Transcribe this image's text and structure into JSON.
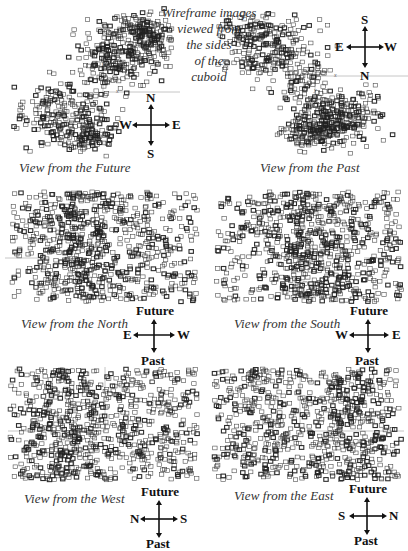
{
  "figure": {
    "background": "#ffffff",
    "marker_color": "#222222",
    "axis_color": "#b8b8b8",
    "annotation": {
      "lines": [
        "Wireframe images",
        "viewed from",
        "the sides",
        "of the",
        "cuboid"
      ]
    },
    "panels": [
      {
        "id": "future",
        "caption": "View from the Future",
        "axis_labels": {
          "vertical": "y",
          "horizontal": "x"
        },
        "compass": {
          "top": "N",
          "bottom": "S",
          "left": "W",
          "right": "E"
        },
        "point_count": 700,
        "seed": 11
      },
      {
        "id": "past",
        "caption": "View from the Past",
        "axis_labels": {
          "vertical": "y",
          "horizontal": "x"
        },
        "compass": {
          "top": "S",
          "bottom": "N",
          "left": "E",
          "right": "W"
        },
        "point_count": 700,
        "seed": 23
      },
      {
        "id": "north",
        "caption": "View from the North",
        "compass": {
          "top": "Future",
          "bottom": "Past",
          "left": "E",
          "right": "W"
        },
        "point_count": 820,
        "seed": 37
      },
      {
        "id": "south",
        "caption": "View from the South",
        "compass": {
          "top": "Future",
          "bottom": "Past",
          "left": "W",
          "right": "E"
        },
        "point_count": 820,
        "seed": 41
      },
      {
        "id": "west",
        "caption": "View from the West",
        "compass": {
          "top": "Future",
          "bottom": "Past",
          "left": "N",
          "right": "S"
        },
        "point_count": 820,
        "seed": 53
      },
      {
        "id": "east",
        "caption": "View from the East",
        "compass": {
          "top": "Future",
          "bottom": "Past",
          "left": "S",
          "right": "N"
        },
        "point_count": 820,
        "seed": 67
      }
    ]
  }
}
